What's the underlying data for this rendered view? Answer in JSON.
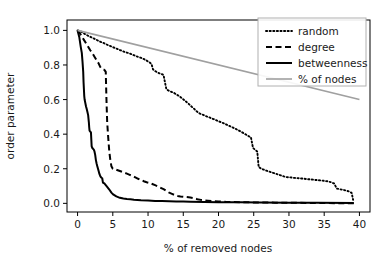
{
  "chart_data": {
    "type": "line",
    "title": "",
    "xlabel": "% of removed nodes",
    "ylabel": "order parameter",
    "xlim": [
      -1.5,
      41.5
    ],
    "ylim": [
      -0.05,
      1.06
    ],
    "xticks": [
      0,
      5,
      10,
      15,
      20,
      25,
      30,
      35,
      40
    ],
    "xtick_labels": [
      "0",
      "5",
      "10",
      "15",
      "20",
      "25",
      "30",
      "35",
      "40"
    ],
    "yticks": [
      0.0,
      0.2,
      0.4,
      0.6,
      0.8,
      1.0
    ],
    "ytick_labels": [
      "0.0",
      "0.2",
      "0.4",
      "0.6",
      "0.8",
      "1.0"
    ],
    "grid": false,
    "legend_position": "upper right",
    "series": [
      {
        "name": "random",
        "style": "dotted",
        "color": "#000000",
        "points": [
          [
            0.0,
            1.0
          ],
          [
            0.4,
            0.995
          ],
          [
            0.8,
            0.985
          ],
          [
            1.2,
            0.975
          ],
          [
            1.7,
            0.965
          ],
          [
            2.2,
            0.955
          ],
          [
            2.7,
            0.945
          ],
          [
            3.2,
            0.935
          ],
          [
            3.8,
            0.925
          ],
          [
            4.3,
            0.915
          ],
          [
            4.9,
            0.905
          ],
          [
            5.5,
            0.895
          ],
          [
            6.1,
            0.885
          ],
          [
            6.7,
            0.875
          ],
          [
            7.3,
            0.868
          ],
          [
            7.9,
            0.858
          ],
          [
            8.5,
            0.848
          ],
          [
            9.1,
            0.84
          ],
          [
            9.7,
            0.828
          ],
          [
            10.2,
            0.815
          ],
          [
            10.5,
            0.805
          ],
          [
            10.7,
            0.775
          ],
          [
            11.0,
            0.765
          ],
          [
            11.3,
            0.758
          ],
          [
            11.6,
            0.752
          ],
          [
            11.9,
            0.748
          ],
          [
            12.2,
            0.742
          ],
          [
            12.4,
            0.7
          ],
          [
            12.6,
            0.66
          ],
          [
            12.9,
            0.652
          ],
          [
            13.3,
            0.645
          ],
          [
            13.7,
            0.638
          ],
          [
            14.1,
            0.628
          ],
          [
            14.5,
            0.618
          ],
          [
            14.9,
            0.605
          ],
          [
            15.3,
            0.592
          ],
          [
            15.7,
            0.578
          ],
          [
            16.1,
            0.562
          ],
          [
            16.5,
            0.548
          ],
          [
            16.9,
            0.532
          ],
          [
            17.3,
            0.52
          ],
          [
            17.8,
            0.512
          ],
          [
            18.3,
            0.503
          ],
          [
            18.8,
            0.495
          ],
          [
            19.3,
            0.487
          ],
          [
            19.8,
            0.478
          ],
          [
            20.3,
            0.47
          ],
          [
            20.8,
            0.462
          ],
          [
            21.3,
            0.452
          ],
          [
            21.8,
            0.443
          ],
          [
            22.3,
            0.433
          ],
          [
            22.8,
            0.423
          ],
          [
            23.3,
            0.412
          ],
          [
            23.8,
            0.4
          ],
          [
            24.2,
            0.39
          ],
          [
            24.6,
            0.382
          ],
          [
            24.9,
            0.32
          ],
          [
            25.2,
            0.31
          ],
          [
            25.5,
            0.3
          ],
          [
            25.7,
            0.21
          ],
          [
            26.1,
            0.2
          ],
          [
            26.6,
            0.192
          ],
          [
            27.1,
            0.185
          ],
          [
            27.6,
            0.178
          ],
          [
            28.1,
            0.172
          ],
          [
            28.6,
            0.165
          ],
          [
            29.1,
            0.158
          ],
          [
            29.6,
            0.152
          ],
          [
            30.2,
            0.15
          ],
          [
            30.8,
            0.147
          ],
          [
            31.4,
            0.145
          ],
          [
            32.0,
            0.143
          ],
          [
            32.6,
            0.14
          ],
          [
            33.2,
            0.138
          ],
          [
            33.8,
            0.135
          ],
          [
            34.4,
            0.133
          ],
          [
            35.0,
            0.13
          ],
          [
            35.5,
            0.127
          ],
          [
            36.0,
            0.122
          ],
          [
            36.4,
            0.115
          ],
          [
            36.8,
            0.085
          ],
          [
            37.2,
            0.082
          ],
          [
            37.7,
            0.078
          ],
          [
            38.2,
            0.073
          ],
          [
            38.6,
            0.068
          ],
          [
            38.9,
            0.06
          ],
          [
            39.1,
            0.02
          ]
        ]
      },
      {
        "name": "degree",
        "style": "dashed",
        "color": "#000000",
        "points": [
          [
            0.0,
            1.0
          ],
          [
            0.3,
            0.985
          ],
          [
            0.6,
            0.965
          ],
          [
            0.9,
            0.945
          ],
          [
            1.2,
            0.925
          ],
          [
            1.5,
            0.905
          ],
          [
            1.8,
            0.885
          ],
          [
            2.1,
            0.868
          ],
          [
            2.4,
            0.848
          ],
          [
            2.7,
            0.828
          ],
          [
            3.0,
            0.808
          ],
          [
            3.2,
            0.79
          ],
          [
            3.4,
            0.778
          ],
          [
            3.6,
            0.775
          ],
          [
            3.8,
            0.772
          ],
          [
            4.0,
            0.76
          ],
          [
            4.1,
            0.6
          ],
          [
            4.2,
            0.47
          ],
          [
            4.35,
            0.38
          ],
          [
            4.5,
            0.3
          ],
          [
            4.65,
            0.25
          ],
          [
            4.8,
            0.215
          ],
          [
            5.0,
            0.2
          ],
          [
            5.4,
            0.196
          ],
          [
            5.8,
            0.19
          ],
          [
            6.2,
            0.184
          ],
          [
            6.6,
            0.178
          ],
          [
            7.0,
            0.172
          ],
          [
            7.4,
            0.165
          ],
          [
            7.8,
            0.158
          ],
          [
            8.2,
            0.15
          ],
          [
            8.6,
            0.142
          ],
          [
            9.0,
            0.135
          ],
          [
            9.4,
            0.128
          ],
          [
            9.8,
            0.122
          ],
          [
            10.2,
            0.118
          ],
          [
            10.6,
            0.112
          ],
          [
            11.0,
            0.105
          ],
          [
            11.4,
            0.098
          ],
          [
            11.8,
            0.09
          ],
          [
            12.2,
            0.082
          ],
          [
            12.6,
            0.072
          ],
          [
            13.0,
            0.062
          ],
          [
            13.4,
            0.055
          ],
          [
            13.8,
            0.048
          ],
          [
            14.2,
            0.043
          ],
          [
            14.6,
            0.04
          ],
          [
            15.0,
            0.038
          ],
          [
            15.5,
            0.036
          ],
          [
            16.0,
            0.034
          ],
          [
            16.5,
            0.03
          ],
          [
            17.0,
            0.024
          ],
          [
            17.5,
            0.02
          ],
          [
            18.0,
            0.017
          ],
          [
            18.5,
            0.015
          ],
          [
            19.0,
            0.013
          ],
          [
            20.0,
            0.011
          ],
          [
            21.0,
            0.009
          ],
          [
            22.0,
            0.008
          ],
          [
            24.0,
            0.006
          ],
          [
            26.0,
            0.005
          ],
          [
            28.0,
            0.004
          ],
          [
            31.0,
            0.003
          ],
          [
            34.0,
            0.002
          ],
          [
            37.0,
            0.001
          ],
          [
            39.2,
            0.0
          ]
        ]
      },
      {
        "name": "betweenness",
        "style": "solid",
        "color": "#000000",
        "points": [
          [
            0.0,
            1.0
          ],
          [
            0.25,
            0.96
          ],
          [
            0.45,
            0.905
          ],
          [
            0.6,
            0.87
          ],
          [
            0.7,
            0.82
          ],
          [
            0.8,
            0.76
          ],
          [
            0.85,
            0.7
          ],
          [
            0.9,
            0.66
          ],
          [
            0.95,
            0.62
          ],
          [
            1.0,
            0.6
          ],
          [
            1.1,
            0.58
          ],
          [
            1.2,
            0.56
          ],
          [
            1.3,
            0.545
          ],
          [
            1.4,
            0.528
          ],
          [
            1.5,
            0.51
          ],
          [
            1.6,
            0.47
          ],
          [
            1.65,
            0.44
          ],
          [
            1.7,
            0.42
          ],
          [
            1.8,
            0.415
          ],
          [
            1.9,
            0.41
          ],
          [
            2.0,
            0.33
          ],
          [
            2.1,
            0.32
          ],
          [
            2.2,
            0.315
          ],
          [
            2.3,
            0.31
          ],
          [
            2.4,
            0.3
          ],
          [
            2.5,
            0.28
          ],
          [
            2.6,
            0.25
          ],
          [
            2.7,
            0.23
          ],
          [
            2.8,
            0.215
          ],
          [
            2.9,
            0.2
          ],
          [
            3.0,
            0.185
          ],
          [
            3.1,
            0.17
          ],
          [
            3.2,
            0.16
          ],
          [
            3.3,
            0.152
          ],
          [
            3.4,
            0.148
          ],
          [
            3.5,
            0.145
          ],
          [
            3.6,
            0.12
          ],
          [
            3.8,
            0.115
          ],
          [
            4.0,
            0.105
          ],
          [
            4.2,
            0.095
          ],
          [
            4.5,
            0.08
          ],
          [
            4.8,
            0.062
          ],
          [
            5.1,
            0.05
          ],
          [
            5.5,
            0.04
          ],
          [
            6.0,
            0.032
          ],
          [
            6.5,
            0.028
          ],
          [
            7.0,
            0.025
          ],
          [
            7.5,
            0.023
          ],
          [
            8.0,
            0.021
          ],
          [
            9.0,
            0.018
          ],
          [
            10.0,
            0.016
          ],
          [
            11.0,
            0.014
          ],
          [
            12.0,
            0.013
          ],
          [
            13.0,
            0.012
          ],
          [
            14.0,
            0.011
          ],
          [
            15.0,
            0.01
          ],
          [
            16.0,
            0.009
          ],
          [
            18.0,
            0.008
          ],
          [
            20.0,
            0.007
          ],
          [
            23.0,
            0.006
          ],
          [
            26.0,
            0.005
          ],
          [
            30.0,
            0.004
          ],
          [
            34.0,
            0.003
          ],
          [
            39.2,
            0.002
          ]
        ]
      },
      {
        "name": "% of nodes",
        "style": "solid-gray",
        "color": "#a0a0a0",
        "points": [
          [
            0.0,
            1.0
          ],
          [
            40.0,
            0.6
          ]
        ]
      }
    ]
  },
  "legend": {
    "entries": [
      {
        "label": "random",
        "style": "dotted",
        "color": "#000000"
      },
      {
        "label": "degree",
        "style": "dashed",
        "color": "#000000"
      },
      {
        "label": "betweenness",
        "style": "solid",
        "color": "#000000"
      },
      {
        "label": "% of nodes",
        "style": "solid-gray",
        "color": "#a0a0a0"
      }
    ]
  }
}
